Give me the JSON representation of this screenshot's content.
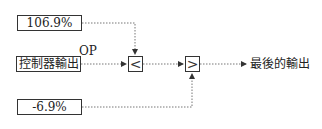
{
  "inputs": {
    "upper_limit": "106.9%",
    "controller_output": "控制器輸出",
    "lower_limit": "-6.9%"
  },
  "signal_label": "OP",
  "operators": {
    "min_selector": "<",
    "max_selector": ">"
  },
  "output_label": "最後的輸出",
  "colors": {
    "line": "#555555",
    "border": "#333333"
  }
}
